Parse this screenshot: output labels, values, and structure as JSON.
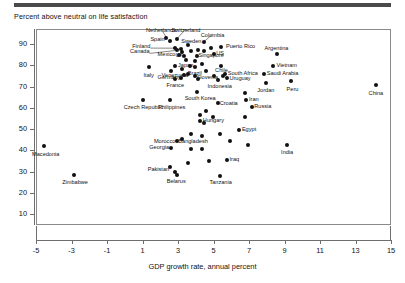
{
  "header": {
    "rule": "divider",
    "title": "Percent above neutral on life satisfaction"
  },
  "chart_data": {
    "type": "scatter",
    "title": "Percent above neutral on life satisfaction",
    "xlabel": "GDP growth rate, annual percent",
    "ylabel": "Percent above neutral on life satisfaction",
    "xlim": [
      -5,
      15
    ],
    "ylim": [
      5,
      97
    ],
    "xticks": [
      -5,
      -3,
      -1,
      1,
      3,
      5,
      7,
      9,
      11,
      13,
      15
    ],
    "yticks": [
      10,
      20,
      30,
      40,
      50,
      60,
      70,
      80,
      90
    ],
    "grid": false,
    "legend": "none",
    "marker_color": "#111111",
    "points": [
      {
        "label": "Netherlands",
        "x": 2.35,
        "y": 93.0,
        "lp": "c",
        "lx": 2.05,
        "ly": 97.5,
        "leader": true
      },
      {
        "label": "Switzerland",
        "x": 2.95,
        "y": 92.5,
        "lp": "c",
        "lx": 3.45,
        "ly": 97.5,
        "leader": true
      },
      {
        "label": "Colombia",
        "x": 4.45,
        "y": 91.0,
        "lp": "c",
        "lx": 4.95,
        "ly": 95.0,
        "leader": true
      },
      {
        "label": "Spain",
        "x": 2.55,
        "y": 91.5,
        "lp": "l",
        "lx": 2.25,
        "ly": 92.0,
        "leader": false
      },
      {
        "label": "Sweden",
        "x": 3.55,
        "y": 89.5,
        "lp": "c",
        "lx": 3.75,
        "ly": 92.5,
        "leader": false
      },
      {
        "label": "Puerto Rico",
        "x": 5.45,
        "y": 88.5,
        "lp": "r",
        "lx": 5.7,
        "ly": 88.5,
        "leader": false
      },
      {
        "label": "Argentina",
        "x": 8.55,
        "y": 85.5,
        "lp": "c",
        "lx": 8.55,
        "ly": 89.0,
        "leader": false
      },
      {
        "label": "Finland",
        "x": 2.85,
        "y": 88.0,
        "lp": "l",
        "lx": 1.45,
        "ly": 88.5,
        "leader": true
      },
      {
        "label": "Canada",
        "x": 2.95,
        "y": 87.0,
        "lp": "l",
        "lx": 1.4,
        "ly": 86.0,
        "leader": true
      },
      {
        "label": "Mexico",
        "x": 3.05,
        "y": 85.0,
        "lp": "l",
        "lx": 2.85,
        "ly": 85.0,
        "leader": false
      },
      {
        "label": "UK",
        "x": 3.35,
        "y": 84.5,
        "lp": "l",
        "lx": 3.3,
        "ly": 84.5,
        "leader": false
      },
      {
        "label": "Singapore",
        "x": 4.05,
        "y": 84.5,
        "lp": "r",
        "lx": 4.15,
        "ly": 84.5,
        "leader": false
      },
      {
        "label": "US",
        "x": 5.05,
        "y": 85.5,
        "lp": "r",
        "lx": 5.15,
        "ly": 85.5,
        "leader": false
      },
      {
        "label": "Vietnam",
        "x": 8.35,
        "y": 79.5,
        "lp": "r",
        "lx": 8.55,
        "ly": 79.5,
        "leader": false
      },
      {
        "label": "Italy",
        "x": 1.35,
        "y": 79.0,
        "lp": "c",
        "lx": 1.35,
        "ly": 76.5,
        "leader": false
      },
      {
        "label": "Japan",
        "x": 2.85,
        "y": 79.5,
        "lp": "r",
        "lx": 3.0,
        "ly": 79.5,
        "leader": false
      },
      {
        "label": "Germany",
        "x": 2.6,
        "y": 77.5,
        "lp": "c",
        "lx": 2.5,
        "ly": 75.5,
        "leader": false
      },
      {
        "label": "Brazil",
        "x": 3.95,
        "y": 79.0,
        "lp": "c",
        "lx": 3.95,
        "ly": 77.5,
        "leader": false
      },
      {
        "label": "Chile",
        "x": 5.45,
        "y": 79.5,
        "lp": "c",
        "lx": 5.45,
        "ly": 78.5,
        "leader": false
      },
      {
        "label": "Venezuela",
        "x": 3.55,
        "y": 76.0,
        "lp": "l",
        "lx": 3.55,
        "ly": 75.0,
        "leader": true
      },
      {
        "label": "Slovenia",
        "x": 3.95,
        "y": 75.0,
        "lp": "r",
        "lx": 4.05,
        "ly": 74.0,
        "leader": false
      },
      {
        "label": "South Africa",
        "x": 5.65,
        "y": 76.0,
        "lp": "r",
        "lx": 5.8,
        "ly": 76.0,
        "leader": false
      },
      {
        "label": "Saudi Arabia",
        "x": 7.85,
        "y": 76.0,
        "lp": "r",
        "lx": 8.0,
        "ly": 76.0,
        "leader": false
      },
      {
        "label": "Uruguay",
        "x": 5.75,
        "y": 74.0,
        "lp": "r",
        "lx": 5.9,
        "ly": 73.5,
        "leader": false
      },
      {
        "label": "France",
        "x": 2.85,
        "y": 73.5,
        "lp": "c",
        "lx": 2.85,
        "ly": 71.5,
        "leader": false
      },
      {
        "label": "Indonesia",
        "x": 5.25,
        "y": 73.0,
        "lp": "c",
        "lx": 5.35,
        "ly": 71.0,
        "leader": false
      },
      {
        "label": "Jordan",
        "x": 7.95,
        "y": 71.5,
        "lp": "c",
        "lx": 7.95,
        "ly": 69.5,
        "leader": false
      },
      {
        "label": "Peru",
        "x": 9.35,
        "y": 72.5,
        "lp": "c",
        "lx": 9.45,
        "ly": 70.0,
        "leader": false
      },
      {
        "label": "China",
        "x": 14.15,
        "y": 70.5,
        "lp": "c",
        "lx": 14.15,
        "ly": 68.0,
        "leader": false
      },
      {
        "label": "South Korea",
        "x": 4.05,
        "y": 67.5,
        "lp": "c",
        "lx": 4.25,
        "ly": 65.5,
        "leader": false
      },
      {
        "label": "Czech Republic",
        "x": 1.05,
        "y": 63.5,
        "lp": "c",
        "lx": 1.05,
        "ly": 61.5,
        "leader": false
      },
      {
        "label": "Philippines",
        "x": 2.55,
        "y": 63.5,
        "lp": "c",
        "lx": 2.65,
        "ly": 61.5,
        "leader": false
      },
      {
        "label": "Croatia",
        "x": 5.25,
        "y": 62.5,
        "lp": "r",
        "lx": 5.35,
        "ly": 62.0,
        "leader": false
      },
      {
        "label": "Iran",
        "x": 6.85,
        "y": 63.5,
        "lp": "r",
        "lx": 7.0,
        "ly": 63.5,
        "leader": false
      },
      {
        "label": "Russia",
        "x": 7.15,
        "y": 60.5,
        "lp": "r",
        "lx": 7.3,
        "ly": 60.5,
        "leader": false
      },
      {
        "label": "Hungary",
        "x": 4.25,
        "y": 54.0,
        "lp": "r",
        "lx": 4.4,
        "ly": 54.0,
        "leader": false
      },
      {
        "label": "Egypt",
        "x": 6.45,
        "y": 49.5,
        "lp": "r",
        "lx": 6.6,
        "ly": 49.5,
        "leader": false
      },
      {
        "label": "Bangladesh",
        "x": 3.75,
        "y": 47.5,
        "lp": "c",
        "lx": 3.85,
        "ly": 45.5,
        "leader": false
      },
      {
        "label": "Morocco",
        "x": 2.95,
        "y": 44.5,
        "lp": "l",
        "lx": 2.85,
        "ly": 44.0,
        "leader": false
      },
      {
        "label": "Georgia",
        "x": 2.6,
        "y": 41.0,
        "lp": "l",
        "lx": 2.5,
        "ly": 41.0,
        "leader": false
      },
      {
        "label": "India",
        "x": 9.15,
        "y": 42.5,
        "lp": "c",
        "lx": 9.15,
        "ly": 40.0,
        "leader": false
      },
      {
        "label": "Macedonia",
        "x": -4.55,
        "y": 42.0,
        "lp": "c",
        "lx": -4.45,
        "ly": 39.5,
        "leader": false
      },
      {
        "label": "Iraq",
        "x": 5.75,
        "y": 35.5,
        "lp": "r",
        "lx": 5.9,
        "ly": 35.5,
        "leader": false
      },
      {
        "label": "Pakistan",
        "x": 2.55,
        "y": 32.0,
        "lp": "l",
        "lx": 2.5,
        "ly": 31.0,
        "leader": false
      },
      {
        "label": "Belarus",
        "x": 2.95,
        "y": 28.5,
        "lp": "c",
        "lx": 2.9,
        "ly": 26.5,
        "leader": false
      },
      {
        "label": "Tanzania",
        "x": 5.35,
        "y": 28.0,
        "lp": "c",
        "lx": 5.4,
        "ly": 26.0,
        "leader": false
      },
      {
        "label": "Zimbabwe",
        "x": -2.85,
        "y": 28.5,
        "lp": "c",
        "lx": -2.8,
        "ly": 26.0,
        "leader": false
      }
    ],
    "unlabeled_points": [
      {
        "x": 3.15,
        "y": 87.5
      },
      {
        "x": 3.25,
        "y": 86.0
      },
      {
        "x": 3.75,
        "y": 86.5
      },
      {
        "x": 4.15,
        "y": 87.0
      },
      {
        "x": 4.45,
        "y": 86.5
      },
      {
        "x": 4.85,
        "y": 88.0
      },
      {
        "x": 3.45,
        "y": 82.5
      },
      {
        "x": 3.95,
        "y": 82.0
      },
      {
        "x": 4.35,
        "y": 80.5
      },
      {
        "x": 3.25,
        "y": 78.0
      },
      {
        "x": 3.65,
        "y": 79.5
      },
      {
        "x": 4.55,
        "y": 77.5
      },
      {
        "x": 3.35,
        "y": 75.5
      },
      {
        "x": 3.15,
        "y": 74.0
      },
      {
        "x": 4.15,
        "y": 73.5
      },
      {
        "x": 5.05,
        "y": 75.0
      },
      {
        "x": 5.55,
        "y": 75.0
      },
      {
        "x": 6.75,
        "y": 67.0
      },
      {
        "x": 4.55,
        "y": 58.5
      },
      {
        "x": 4.25,
        "y": 56.5
      },
      {
        "x": 4.95,
        "y": 55.5
      },
      {
        "x": 4.45,
        "y": 53.0
      },
      {
        "x": 6.75,
        "y": 55.5
      },
      {
        "x": 4.35,
        "y": 47.0
      },
      {
        "x": 5.35,
        "y": 47.5
      },
      {
        "x": 3.25,
        "y": 45.5
      },
      {
        "x": 5.95,
        "y": 44.5
      },
      {
        "x": 6.95,
        "y": 42.5
      },
      {
        "x": 3.75,
        "y": 40.5
      },
      {
        "x": 4.35,
        "y": 40.5
      },
      {
        "x": 3.55,
        "y": 34.0
      },
      {
        "x": 4.75,
        "y": 35.0
      },
      {
        "x": 2.85,
        "y": 30.0
      }
    ]
  }
}
